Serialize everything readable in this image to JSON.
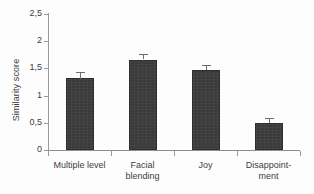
{
  "chart_data": {
    "type": "bar",
    "title": "",
    "xlabel": "",
    "ylabel": "Similarity score",
    "categories": [
      "Multiple level",
      "Facial blending",
      "Joy",
      "Disappointment"
    ],
    "category_lines": [
      [
        "Multiple level"
      ],
      [
        "Facial",
        "blending"
      ],
      [
        "Joy"
      ],
      [
        "Disappoint-",
        "ment"
      ]
    ],
    "values": [
      1.32,
      1.66,
      1.47,
      0.5
    ],
    "errors": [
      0.12,
      0.1,
      0.09,
      0.09
    ],
    "ylim": [
      0,
      2.5
    ],
    "yticks": [
      0,
      0.5,
      1,
      1.5,
      2,
      2.5
    ],
    "ytick_labels": [
      "0",
      "0,5",
      "1",
      "1,5",
      "2",
      "2,5"
    ],
    "grid": false,
    "legend": null,
    "decimal_separator": ",",
    "bar_color": "#3a3a3a",
    "error_bar_color": "#6d6d6d",
    "axis_color": "#9a9a9a",
    "background_color": "#fdfdfd"
  }
}
